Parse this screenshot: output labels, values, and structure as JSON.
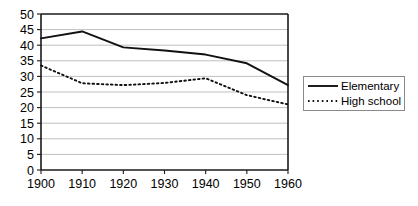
{
  "chart_data": {
    "type": "line",
    "title": "",
    "subtitle": "",
    "xlabel": "",
    "ylabel": "",
    "x": [
      1900,
      1910,
      1920,
      1930,
      1940,
      1950,
      1960
    ],
    "categories": [
      "1900",
      "1910",
      "1920",
      "1930",
      "1940",
      "1950",
      "1960"
    ],
    "xlim": [
      1900,
      1960
    ],
    "ylim": [
      0,
      50
    ],
    "y_ticks": [
      0,
      5,
      10,
      15,
      20,
      25,
      30,
      35,
      40,
      45,
      50
    ],
    "y_tick_labels": [
      "0",
      "5",
      "10",
      "15",
      "20",
      "25",
      "30",
      "35",
      "40",
      "45",
      "50"
    ],
    "x_ticks": [
      1900,
      1910,
      1920,
      1930,
      1940,
      1950,
      1960
    ],
    "x_tick_labels": [
      "1900",
      "1910",
      "1920",
      "1930",
      "1940",
      "1950",
      "1960"
    ],
    "grid": "horizontal",
    "legend_position": "right",
    "series": [
      {
        "name": "Elementary",
        "style": "solid",
        "color": "#111111",
        "values": [
          42.2,
          44.4,
          39.3,
          38.3,
          37.0,
          34.2,
          27.2
        ]
      },
      {
        "name": "High school",
        "style": "dotted",
        "color": "#111111",
        "values": [
          33.5,
          27.8,
          27.2,
          27.9,
          29.4,
          24.0,
          21.0
        ]
      }
    ],
    "annotations": []
  },
  "legend": {
    "entries": [
      {
        "label": "Elementary",
        "style": "solid"
      },
      {
        "label": "High school",
        "style": "dotted"
      }
    ]
  },
  "colors": {
    "background": "#ffffff",
    "axis": "#1a1a1a",
    "grid": "#b8b8b8",
    "series": "#111111",
    "legend_border": "#8a8a8a"
  }
}
